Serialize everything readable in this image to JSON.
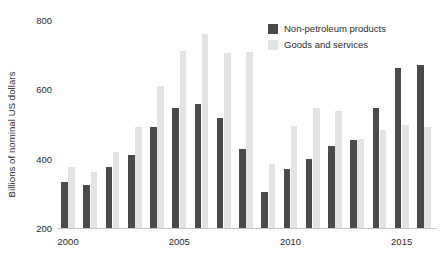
{
  "chart_data": {
    "type": "bar",
    "title": "",
    "subtitle": "",
    "xlabel": "",
    "ylabel": "Billions of nominal US dollars",
    "ylim": [
      200,
      800
    ],
    "y_ticks": [
      200,
      400,
      600,
      800
    ],
    "x_ticks": [
      "2000",
      "2005",
      "2010",
      "2015"
    ],
    "grid": false,
    "legend_position": "top-right",
    "categories": [
      "2000",
      "2001",
      "2002",
      "2003",
      "2004",
      "2005",
      "2006",
      "2007",
      "2008",
      "2009",
      "2010",
      "2011",
      "2012",
      "2013",
      "2014",
      "2015",
      "2016"
    ],
    "series": [
      {
        "name": "Non-petroleum products",
        "color": "#4a4a4a",
        "values": [
          334,
          324,
          377,
          412,
          490,
          545,
          557,
          518,
          428,
          303,
          370,
          400,
          437,
          454,
          546,
          661,
          670
        ]
      },
      {
        "name": "Goods and services",
        "color": "#e3e3e3",
        "values": [
          375,
          363,
          419,
          490,
          610,
          712,
          760,
          705,
          708,
          385,
          495,
          546,
          538,
          457,
          484,
          498,
          492
        ]
      }
    ]
  },
  "legend": {
    "items": [
      {
        "label": "Non-petroleum products",
        "swatch": "dark"
      },
      {
        "label": "Goods and services",
        "swatch": "light"
      }
    ]
  },
  "axes": {
    "y_title": "Billions of nominal US dollars"
  }
}
